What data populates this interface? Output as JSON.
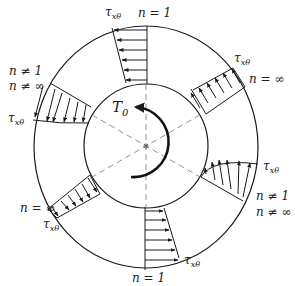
{
  "diagram": {
    "center_label": "T",
    "center_label_sub": "0",
    "stress_symbol": "τ",
    "stress_sub": "xθ",
    "colors": {
      "line": "#1a1a1a",
      "dashed": "#777777",
      "background": "#ffffff"
    },
    "profiles": [
      {
        "id": "top",
        "angle_deg": 90,
        "label_n1": "n = 1",
        "label_n2": "",
        "tau_label": "τxθ",
        "shape": "linear"
      },
      {
        "id": "upper-right",
        "angle_deg": 30,
        "label_n1": "n = ∞",
        "label_n2": "",
        "tau_label": "τxθ",
        "shape": "uniform"
      },
      {
        "id": "lower-right",
        "angle_deg": -30,
        "label_n1": "n ≠ 1",
        "label_n2": "n ≠ ∞",
        "tau_label": "τxθ",
        "shape": "curved"
      },
      {
        "id": "bottom",
        "angle_deg": -90,
        "label_n1": "n = 1",
        "label_n2": "",
        "tau_label": "τxθ",
        "shape": "linear"
      },
      {
        "id": "lower-left",
        "angle_deg": 210,
        "label_n1": "n = ∞",
        "label_n2": "",
        "tau_label": "τxθ",
        "shape": "uniform"
      },
      {
        "id": "upper-left",
        "angle_deg": 150,
        "label_n1": "n ≠ 1",
        "label_n2": "n ≠ ∞",
        "tau_label": "τxθ",
        "shape": "curved"
      }
    ],
    "labels": {
      "top_n": "n = 1",
      "bottom_n": "n = 1",
      "upper_right_n": "n = ∞",
      "lower_left_n": "n = ∞",
      "upper_left_n1": "n ≠ 1",
      "upper_left_n2": "n ≠ ∞",
      "lower_right_n1": "n ≠ 1",
      "lower_right_n2": "n ≠ ∞",
      "tau": "τ",
      "tau_sub": "xθ",
      "torque": "T",
      "torque_sub": "0"
    }
  }
}
